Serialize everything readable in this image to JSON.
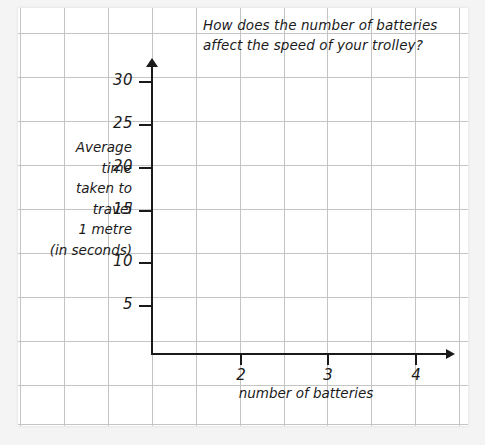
{
  "chart_data": {
    "type": "line",
    "title": "How does the number of batteries affect the speed of your trolley?",
    "title_lines": [
      "How does the number of batteries",
      "affect the speed of your trolley?"
    ],
    "xlabel": "number of batteries",
    "ylabel": "Average time taken to travel 1 metre (in seconds)",
    "ylabel_lines": [
      "Average",
      "time",
      "taken to",
      "travel",
      "1 metre",
      "(in seconds)"
    ],
    "x_ticks": [
      "2",
      "3",
      "4"
    ],
    "y_ticks": [
      "5",
      "10",
      "15",
      "20",
      "25",
      "30"
    ],
    "xlim": [
      0,
      4.4
    ],
    "ylim": [
      0,
      33
    ],
    "series": [],
    "values": [],
    "categories": [],
    "grid": true,
    "grid_style": "graph-paper",
    "legend": "none",
    "note": "Empty axes — no data plotted",
    "colors": {
      "background": "#f4f4f4",
      "panel": "#ffffff",
      "gridline": "#c4c4c4",
      "axis": "#1a1a1a",
      "text": "#1a1a1a"
    }
  },
  "layout": {
    "grid_vertical_x": [
      20,
      64,
      108,
      152,
      196,
      240,
      284,
      327,
      371,
      415,
      459
    ],
    "grid_horizontal_y": [
      33,
      77,
      121,
      165,
      209,
      253,
      297,
      341,
      385,
      424
    ],
    "y_tick_positions": [
      {
        "label": "30",
        "y": 81
      },
      {
        "label": "25",
        "y": 124
      },
      {
        "label": "20",
        "y": 167
      },
      {
        "label": "15",
        "y": 210
      },
      {
        "label": "10",
        "y": 262
      },
      {
        "label": "5",
        "y": 305
      }
    ],
    "x_tick_positions": [
      {
        "label": "2",
        "x": 240
      },
      {
        "label": "3",
        "x": 327
      },
      {
        "label": "4",
        "x": 415
      }
    ]
  }
}
